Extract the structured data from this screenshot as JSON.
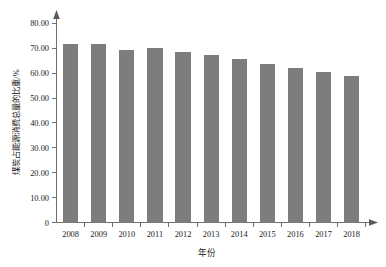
{
  "chart_data": {
    "type": "bar",
    "title": "",
    "xlabel": "年份",
    "ylabel": "煤炭占能源消费总量的比重/%",
    "categories": [
      "2008",
      "2009",
      "2010",
      "2011",
      "2012",
      "2013",
      "2014",
      "2015",
      "2016",
      "2017",
      "2018"
    ],
    "values": [
      71.5,
      71.6,
      69.2,
      70.2,
      68.5,
      67.4,
      65.6,
      63.7,
      62.0,
      60.4,
      59.0
    ],
    "series": [
      {
        "name": "煤炭占能源消费总量的比重",
        "values": [
          71.5,
          71.6,
          69.2,
          70.2,
          68.5,
          67.4,
          65.6,
          63.7,
          62.0,
          60.4,
          59.0
        ]
      }
    ],
    "ylim": [
      0,
      80
    ],
    "ytick_labels": [
      "0",
      "10.00",
      "20.00",
      "30.00",
      "40.00",
      "50.00",
      "60.00",
      "70.00",
      "80.00"
    ],
    "ytick_values": [
      0,
      10,
      20,
      30,
      40,
      50,
      60,
      70,
      80
    ],
    "grid": false,
    "legend": false,
    "legend_position": "none",
    "bar_color": "#7d7d7d",
    "axis_color": "#6e6e6e",
    "background_color": "#ffffff"
  }
}
